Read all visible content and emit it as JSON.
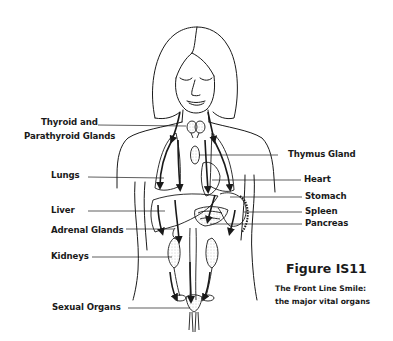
{
  "figure": {
    "title": "Figure IS11",
    "caption_line1": "The Front Line Smile:",
    "caption_line2": "the major vital organs"
  },
  "labels": {
    "left": [
      {
        "id": "thyroid",
        "line1": "Thyroid and",
        "line2": "Parathyroid Glands"
      },
      {
        "id": "lungs",
        "text": "Lungs"
      },
      {
        "id": "liver",
        "text": "Liver"
      },
      {
        "id": "adrenal",
        "text": "Adrenal Glands"
      },
      {
        "id": "kidneys",
        "text": "Kidneys"
      },
      {
        "id": "sexual",
        "text": "Sexual Organs"
      }
    ],
    "right": [
      {
        "id": "thymus",
        "text": "Thymus Gland"
      },
      {
        "id": "heart",
        "text": "Heart"
      },
      {
        "id": "stomach",
        "text": "Stomach"
      },
      {
        "id": "spleen",
        "text": "Spleen"
      },
      {
        "id": "pancreas",
        "text": "Pancreas"
      }
    ]
  },
  "colors": {
    "ink": "#1a1a1a",
    "background": "#ffffff",
    "stipple": "#8a8a8a"
  }
}
